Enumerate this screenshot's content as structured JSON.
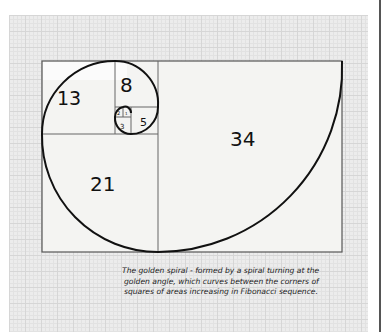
{
  "diagram": {
    "title": "Golden spiral",
    "squares": [
      {
        "label": "34"
      },
      {
        "label": "21"
      },
      {
        "label": "13"
      },
      {
        "label": "8"
      },
      {
        "label": "5"
      },
      {
        "label": "3"
      },
      {
        "label": "2"
      },
      {
        "label": "1"
      }
    ]
  },
  "caption": {
    "lines": [
      "The golden spiral - formed by a spiral turning at the",
      "golden angle, which curves between the corners of",
      "squares of areas increasing in Fibonacci sequence."
    ]
  }
}
